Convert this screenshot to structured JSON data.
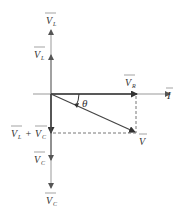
{
  "diagram": {
    "type": "phasor-diagram",
    "colors": {
      "axis": "#888888",
      "vector": "#333333",
      "dashed": "#666666",
      "text": "#333333"
    },
    "labels": {
      "vl_top": {
        "main": "V",
        "sub": "L"
      },
      "vl": {
        "main": "V",
        "sub": "L"
      },
      "vr": {
        "main": "V",
        "sub": "R"
      },
      "i": {
        "main": "I"
      },
      "theta": "θ",
      "v": {
        "main": "V"
      },
      "vl_plus_vc": {
        "a_main": "V",
        "a_sub": "L",
        "plus": "+",
        "b_main": "V",
        "b_sub": "C"
      },
      "vc": {
        "main": "V",
        "sub": "C"
      },
      "vc_bottom": {
        "main": "V",
        "sub": "C"
      }
    }
  }
}
